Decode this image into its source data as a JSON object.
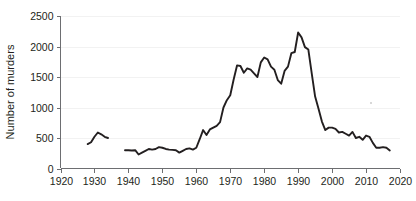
{
  "chart_data": {
    "type": "line",
    "title": "",
    "subtitle": "",
    "xlabel": "",
    "ylabel": "Number of murders",
    "xlim": [
      1920,
      2020
    ],
    "ylim": [
      0,
      2500
    ],
    "grid": true,
    "legend": "none",
    "xticks": [
      1920,
      1930,
      1940,
      1950,
      1960,
      1970,
      1980,
      1990,
      2000,
      2010,
      2020
    ],
    "yticks": [
      0,
      500,
      1000,
      1500,
      2000,
      2500
    ],
    "line_color": "#231f20",
    "series": [
      {
        "name": "murders-early",
        "x": [
          1928,
          1929,
          1930,
          1931,
          1932,
          1933,
          1934
        ],
        "values": [
          400,
          430,
          520,
          590,
          560,
          520,
          500
        ]
      },
      {
        "name": "murders-modern",
        "x": [
          1939,
          1940,
          1941,
          1942,
          1943,
          1944,
          1945,
          1946,
          1947,
          1948,
          1949,
          1950,
          1951,
          1952,
          1953,
          1954,
          1955,
          1956,
          1957,
          1958,
          1959,
          1960,
          1961,
          1962,
          1963,
          1964,
          1965,
          1966,
          1967,
          1968,
          1969,
          1970,
          1971,
          1972,
          1973,
          1974,
          1975,
          1976,
          1977,
          1978,
          1979,
          1980,
          1981,
          1982,
          1983,
          1984,
          1985,
          1986,
          1987,
          1988,
          1989,
          1990,
          1991,
          1992,
          1993,
          1994,
          1995,
          1996,
          1997,
          1998,
          1999,
          2000,
          2001,
          2002,
          2003,
          2004,
          2005,
          2006,
          2007,
          2008,
          2009,
          2010,
          2011,
          2012,
          2013,
          2014,
          2015,
          2016,
          2017
        ],
        "values": [
          300,
          300,
          295,
          300,
          230,
          260,
          290,
          320,
          310,
          320,
          350,
          340,
          320,
          310,
          305,
          300,
          260,
          290,
          320,
          330,
          310,
          340,
          480,
          630,
          550,
          640,
          670,
          700,
          760,
          1000,
          1120,
          1200,
          1460,
          1690,
          1680,
          1570,
          1640,
          1620,
          1560,
          1500,
          1740,
          1820,
          1790,
          1670,
          1620,
          1450,
          1390,
          1600,
          1670,
          1890,
          1910,
          2230,
          2150,
          1990,
          1950,
          1560,
          1180,
          980,
          770,
          630,
          670,
          670,
          650,
          590,
          600,
          570,
          540,
          600,
          500,
          520,
          470,
          540,
          520,
          420,
          340,
          340,
          350,
          340,
          295
        ]
      }
    ]
  },
  "axis": {
    "y_title": "Number of murders",
    "y_tick_labels": [
      "0",
      "500",
      "1000",
      "1500",
      "2000",
      "2500"
    ],
    "x_tick_labels": [
      "1920",
      "1930",
      "1940",
      "1950",
      "1960",
      "1970",
      "1980",
      "1990",
      "2000",
      "2010",
      "2020"
    ]
  }
}
